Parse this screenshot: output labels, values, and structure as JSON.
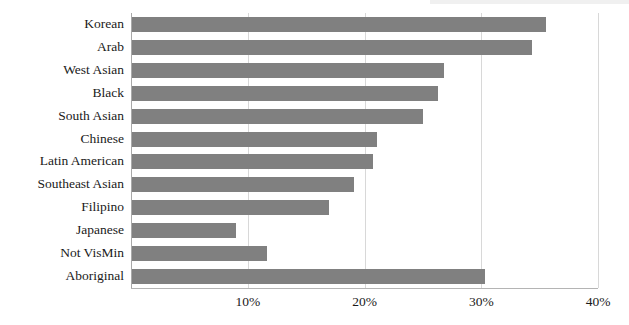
{
  "chart_data": {
    "type": "bar",
    "orientation": "horizontal",
    "title": "",
    "subtitle": "",
    "xlabel": "",
    "ylabel": "",
    "categories": [
      "Korean",
      "Arab",
      "West Asian",
      "Black",
      "South Asian",
      "Chinese",
      "Latin American",
      "Southeast Asian",
      "Filipino",
      "Japanese",
      "Not VisMin",
      "Aboriginal"
    ],
    "values": [
      35.5,
      34.3,
      26.7,
      26.2,
      24.9,
      21.0,
      20.6,
      19.0,
      16.9,
      8.9,
      11.6,
      30.2
    ],
    "xlim": [
      0,
      40
    ],
    "xticks": [
      10,
      20,
      30,
      40
    ],
    "xtick_labels": [
      "10%",
      "20%",
      "30%",
      "40%"
    ],
    "grid": true,
    "grid_axis": "x",
    "legend": false,
    "legend_position": "none",
    "bar_color": "#808080",
    "gridline_color": "#d8d8d8",
    "axis_color": "#b4b4b4",
    "text_color": "#1a1a1a",
    "background_color": "#ffffff"
  }
}
